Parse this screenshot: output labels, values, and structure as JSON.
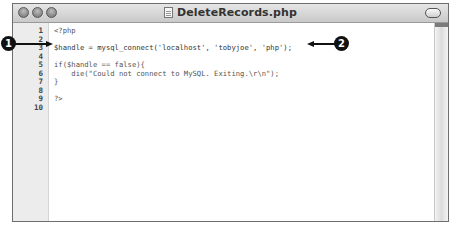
{
  "window": {
    "title": "DeleteRecords.php",
    "controls": [
      "close-button",
      "minimize-button",
      "zoom-button"
    ]
  },
  "editor": {
    "line_numbers": [
      "1",
      "2",
      "3",
      "4",
      "5",
      "6",
      "7",
      "8",
      "9",
      "10"
    ],
    "lines": [
      "<?php",
      "",
      "$handle = mysql_connect('localhost', 'tobyjoe', 'php');",
      "",
      "if($handle == false){",
      "    die(\"Could not connect to MySQL. Exiting.\\r\\n\");",
      "}",
      "",
      "?>",
      ""
    ]
  },
  "callouts": [
    {
      "number": "1",
      "target_line": "3",
      "direction": "points-right"
    },
    {
      "number": "2",
      "target_line": "3",
      "direction": "points-left"
    }
  ],
  "colors": {
    "callout": "#111111",
    "gutter_bg": "#ececec",
    "titlebar_top": "#e6e6e6",
    "titlebar_bottom": "#c9c9c9"
  }
}
